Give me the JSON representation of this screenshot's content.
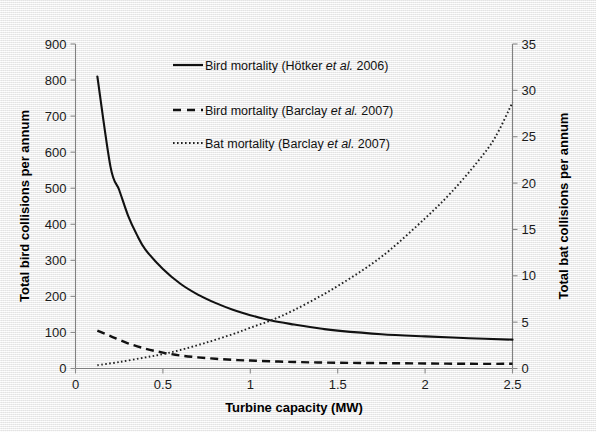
{
  "chart_data": {
    "type": "line",
    "title": "",
    "xlabel": "Turbine capacity (MW)",
    "ylabel": "Total bird collisions per annum",
    "y2label": "Total bat collisions per annum",
    "xlim": [
      0,
      2.5
    ],
    "ylim": [
      0,
      900
    ],
    "y2lim": [
      0,
      35
    ],
    "xticks": [
      "0",
      "0.5",
      "1",
      "1.5",
      "2",
      "2.5"
    ],
    "xtick_values": [
      0,
      0.5,
      1,
      1.5,
      2,
      2.5
    ],
    "yticks": [
      "0",
      "100",
      "200",
      "300",
      "400",
      "500",
      "600",
      "700",
      "800",
      "900"
    ],
    "ytick_values": [
      0,
      100,
      200,
      300,
      400,
      500,
      600,
      700,
      800,
      900
    ],
    "y2ticks": [
      "0",
      "5",
      "10",
      "15",
      "20",
      "25",
      "30",
      "35"
    ],
    "y2tick_values": [
      0,
      5,
      10,
      15,
      20,
      25,
      30,
      35
    ],
    "grid": false,
    "legend_position": "upper-center",
    "series": [
      {
        "name": "Bird mortality (Hötker et al. 2006)",
        "name_prefix": "Bird mortality (Hötker ",
        "name_italic": "et al.",
        "name_suffix": " 2006)",
        "style": "solid",
        "axis": "left",
        "x": [
          0.125,
          0.2,
          0.25,
          0.3,
          0.35,
          0.4,
          0.5,
          0.6,
          0.7,
          0.8,
          0.9,
          1.0,
          1.12,
          1.25,
          1.4,
          1.5,
          1.75,
          2.0,
          2.25,
          2.5
        ],
        "values": [
          810,
          560,
          495,
          425,
          372,
          330,
          276,
          235,
          205,
          182,
          163,
          148,
          133,
          122,
          111,
          105,
          95,
          89,
          84,
          80
        ]
      },
      {
        "name": "Bird mortality (Barclay et al. 2007)",
        "name_prefix": "Bird mortality (Barclay ",
        "name_italic": "et al.",
        "name_suffix": " 2007)",
        "style": "dashed",
        "axis": "left",
        "x": [
          0.125,
          0.2,
          0.3,
          0.4,
          0.5,
          0.6,
          0.7,
          0.8,
          0.9,
          1.0,
          1.25,
          1.5,
          1.75,
          2.0,
          2.25,
          2.5
        ],
        "values": [
          105,
          90,
          70,
          55,
          44,
          36,
          31,
          27,
          24,
          22,
          18,
          16,
          15,
          14,
          13,
          13
        ]
      },
      {
        "name": "Bat mortality (Barclay et al. 2007)",
        "name_prefix": "Bat mortality (Barclay ",
        "name_italic": "et al.",
        "name_suffix": " 2007)",
        "style": "dotted",
        "axis": "right",
        "x": [
          0.125,
          0.25,
          0.4,
          0.5,
          0.6,
          0.75,
          0.9,
          1.0,
          1.12,
          1.25,
          1.4,
          1.5,
          1.65,
          1.8,
          2.0,
          2.15,
          2.3,
          2.4,
          2.5
        ],
        "values": [
          0.35,
          0.7,
          1.2,
          1.55,
          2.0,
          2.8,
          3.7,
          4.4,
          5.2,
          6.3,
          7.8,
          8.9,
          10.7,
          12.8,
          16.2,
          19.0,
          22.3,
          24.9,
          28.7
        ]
      }
    ]
  },
  "axes": {
    "x_title": "Turbine capacity (MW)",
    "y_left_title": "Total bird collisions per annum",
    "y_right_title": "Total bat collisions per annum"
  },
  "colors": {
    "background": "#f3f3f3",
    "ink": "#111111",
    "axis": "#808080"
  }
}
